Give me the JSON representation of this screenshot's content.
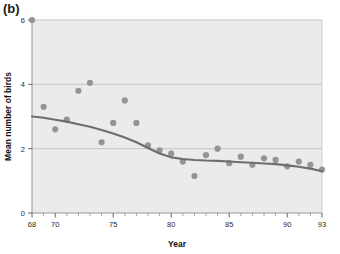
{
  "figure": {
    "panel_label": "(b)",
    "background_color": "#ffffff",
    "plot_background_color": "#ebebeb",
    "marker_color": "#949494",
    "line_color": "#6e6e6e",
    "grid_color": "#b9b9b9",
    "text_color": "#222222"
  },
  "chart_data": {
    "type": "scatter",
    "title": "",
    "xlabel": "Year",
    "ylabel": "Mean number of birds",
    "xlim": [
      68,
      93
    ],
    "ylim": [
      0,
      6
    ],
    "xticks": [
      68,
      70,
      75,
      80,
      85,
      90,
      93
    ],
    "xtick_labels": [
      "68",
      "70",
      "75",
      "80",
      "85",
      "90",
      "93"
    ],
    "xminor_ticks": [
      69,
      71,
      72,
      73,
      74,
      76,
      77,
      78,
      79,
      81,
      82,
      83,
      84,
      86,
      87,
      88,
      89,
      91,
      92
    ],
    "yticks": [
      0,
      2,
      4,
      6
    ],
    "ytick_labels": [
      "0",
      "2",
      "4",
      "6"
    ],
    "grid": true,
    "grid_axis": "y",
    "legend": "none",
    "series": [
      {
        "name": "Mean number of birds",
        "marker": "circle",
        "x": [
          68,
          69,
          70,
          71,
          72,
          73,
          74,
          75,
          76,
          77,
          78,
          79,
          80,
          81,
          82,
          83,
          84,
          85,
          86,
          87,
          88,
          89,
          90,
          91,
          92,
          93
        ],
        "y": [
          6.0,
          3.3,
          2.6,
          2.9,
          3.8,
          4.05,
          2.2,
          2.8,
          3.5,
          2.8,
          2.1,
          1.95,
          1.85,
          1.6,
          1.15,
          1.8,
          2.0,
          1.55,
          1.75,
          1.5,
          1.7,
          1.65,
          1.45,
          1.6,
          1.5,
          1.35
        ]
      },
      {
        "name": "smoothed trend",
        "type": "line",
        "x": [
          68,
          69,
          70,
          71,
          72,
          73,
          74,
          75,
          76,
          77,
          78,
          79,
          80,
          81,
          82,
          83,
          84,
          85,
          86,
          87,
          88,
          89,
          90,
          91,
          92,
          93
        ],
        "y": [
          3.0,
          2.96,
          2.9,
          2.84,
          2.76,
          2.68,
          2.58,
          2.47,
          2.35,
          2.2,
          2.02,
          1.85,
          1.73,
          1.68,
          1.65,
          1.63,
          1.62,
          1.6,
          1.58,
          1.56,
          1.54,
          1.52,
          1.48,
          1.44,
          1.38,
          1.3
        ]
      }
    ]
  }
}
